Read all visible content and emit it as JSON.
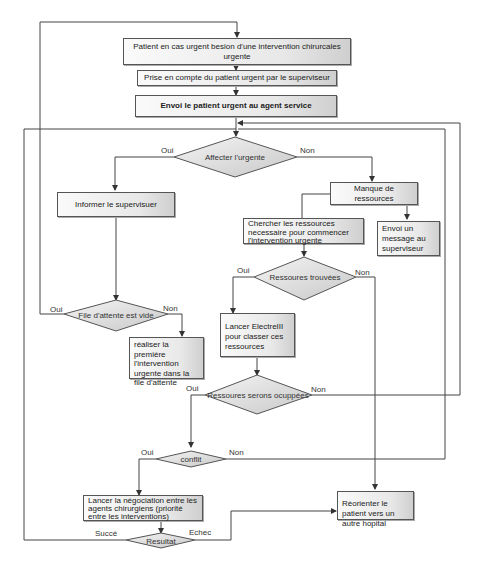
{
  "diagram": {
    "nodes": {
      "patient_urgent": "Patient en cas urgent besion d'une intervention chirurcales urgente",
      "prise_en_compte": "Prise en compte du patient urgent par le superviseur",
      "envoi_agent": "Envoi le patient urgent au agent service",
      "affecter_urgente": "Affecter l'urgente",
      "informer_superviseur": "Informer le supervisuer",
      "manque_ressources": "Manque de ressources",
      "chercher_ressources": "Chercher les ressources necessaire  pour commencer l'intervention urgente",
      "envoi_message": "Envoi un message au superviseur",
      "ressources_trouvees": "Ressoures trouvées",
      "file_attente_vide": "File d'attente est vide",
      "realiser_premiere": "réaliser la première l'intervention urgente dans la file d'attente",
      "lancer_electre": "Lancer ElectreIII pour classer ces ressources",
      "ressources_occupees": "Ressoures serons ocuppées",
      "conflit": "conflit",
      "lancer_negociation": "Lancer la négociation entre les agents chirurgiens (priorité entre les interventions)",
      "reorienter": "Réorienter le patient vers un autre  hopital",
      "resultat": "Resultat"
    },
    "edge_labels": {
      "oui": "Oui",
      "non": "Non",
      "succes": "Succé",
      "echec": "Echec"
    },
    "colors": {
      "line": "#444444",
      "box_border": "#555555",
      "box_fill_light": "#fafafa",
      "box_fill_dark": "#cfcfcf"
    }
  }
}
